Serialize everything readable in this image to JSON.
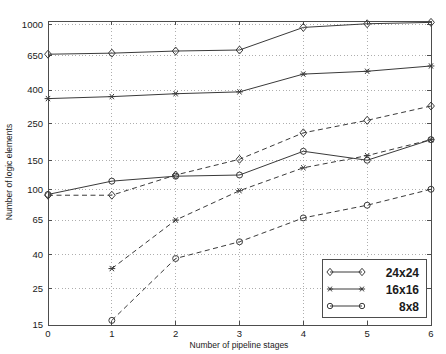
{
  "chart_data": {
    "type": "line",
    "title": "",
    "xlabel": "Number of pipeline stages",
    "ylabel": "Number of logic elements",
    "xscale": "linear",
    "yscale": "log",
    "xlim": [
      0,
      6
    ],
    "ylim": [
      15,
      1050
    ],
    "grid": true,
    "xticks": [
      0,
      1,
      2,
      3,
      4,
      5,
      6
    ],
    "xticklabels": [
      "0",
      "1",
      "2",
      "3",
      "4",
      "5",
      "6"
    ],
    "yticks": [
      15,
      25,
      40,
      65,
      100,
      150,
      250,
      400,
      650,
      1000
    ],
    "yticklabels": [
      "15",
      "25",
      "40",
      "65",
      "100",
      "150",
      "250",
      "400",
      "650",
      "1000"
    ],
    "legend_position": "lower right",
    "legend_entries": [
      "24x24",
      "16x16",
      "8x8"
    ],
    "series": [
      {
        "name": "24x24",
        "style": "solid",
        "marker": "diamond",
        "x": [
          0,
          1,
          2,
          3,
          4,
          5,
          6
        ],
        "values": [
          660,
          670,
          690,
          700,
          960,
          1010,
          1030
        ]
      },
      {
        "name": "16x16",
        "style": "solid",
        "marker": "asterisk",
        "x": [
          0,
          1,
          2,
          3,
          4,
          5,
          6
        ],
        "values": [
          355,
          365,
          380,
          390,
          500,
          520,
          560
        ]
      },
      {
        "name": "8x8",
        "style": "solid",
        "marker": "circle",
        "x": [
          0,
          1,
          2,
          3,
          4,
          5,
          6
        ],
        "values": [
          93,
          112,
          120,
          122,
          170,
          150,
          200
        ]
      },
      {
        "name": "24x24",
        "style": "dashed",
        "marker": "diamond",
        "x": [
          0,
          1,
          2,
          3,
          4,
          5,
          6
        ],
        "values": [
          92,
          92,
          122,
          152,
          220,
          262,
          320
        ]
      },
      {
        "name": "16x16",
        "style": "dashed",
        "marker": "asterisk",
        "x": [
          1,
          2,
          3,
          4,
          5,
          6
        ],
        "values": [
          33,
          65,
          98,
          135,
          160,
          200
        ]
      },
      {
        "name": "8x8",
        "style": "dashed",
        "marker": "circle",
        "x": [
          1,
          2,
          3,
          4,
          5,
          6
        ],
        "values": [
          16,
          38,
          48,
          67,
          80,
          100
        ]
      }
    ]
  },
  "legend": {
    "items": [
      {
        "label": "24x24",
        "marker": "diamond"
      },
      {
        "label": "16x16",
        "marker": "asterisk"
      },
      {
        "label": "8x8",
        "marker": "circle"
      }
    ]
  },
  "colors": {
    "line": "#3a3a3a",
    "axis": "#4d4d4d",
    "grid": "#9a9a9a",
    "text": "#1a1a1a",
    "background": "#ffffff"
  }
}
